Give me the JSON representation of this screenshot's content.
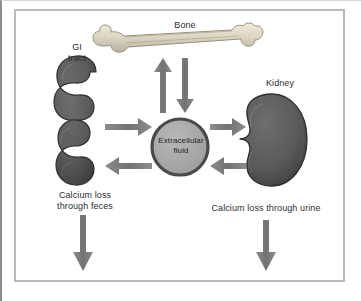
{
  "figure": {
    "background": "#ffffff",
    "frame_color": "#b9b9b9"
  },
  "nodes": {
    "bone": {
      "label": "Bone",
      "icon": "long-bone-icon",
      "color": "#d9d2c0"
    },
    "gi_tract": {
      "label": "GI\ntract",
      "icon": "coiled-intestine-icon",
      "color": "#5a5a5a"
    },
    "kidney": {
      "label": "Kidney",
      "icon": "kidney-icon",
      "color": "#5a5a5a"
    },
    "extracellular_fluid": {
      "label": "Extracellular\nfluid",
      "icon": "circle-icon",
      "fill": "#a8a8a8",
      "stroke": "#4a4a4a"
    }
  },
  "outputs": {
    "feces": {
      "label": "Calcium loss\nthrough feces"
    },
    "urine": {
      "label": "Calcium loss through urine"
    }
  },
  "arrows": {
    "color": "#7b7b7b",
    "items": [
      {
        "name": "bone-to-ecf",
        "direction": "up",
        "from": "extracellular_fluid",
        "to": "bone"
      },
      {
        "name": "ecf-to-bone",
        "direction": "down",
        "from": "bone",
        "to": "extracellular_fluid"
      },
      {
        "name": "gi-to-ecf",
        "direction": "right",
        "from": "gi_tract",
        "to": "extracellular_fluid"
      },
      {
        "name": "ecf-to-gi",
        "direction": "left",
        "from": "extracellular_fluid",
        "to": "gi_tract"
      },
      {
        "name": "ecf-to-kidney",
        "direction": "right",
        "from": "extracellular_fluid",
        "to": "kidney"
      },
      {
        "name": "kidney-to-ecf",
        "direction": "left",
        "from": "kidney",
        "to": "extracellular_fluid"
      },
      {
        "name": "feces-output",
        "direction": "down",
        "from": "gi_tract",
        "to": "feces"
      },
      {
        "name": "urine-output",
        "direction": "down",
        "from": "kidney",
        "to": "urine"
      }
    ]
  }
}
